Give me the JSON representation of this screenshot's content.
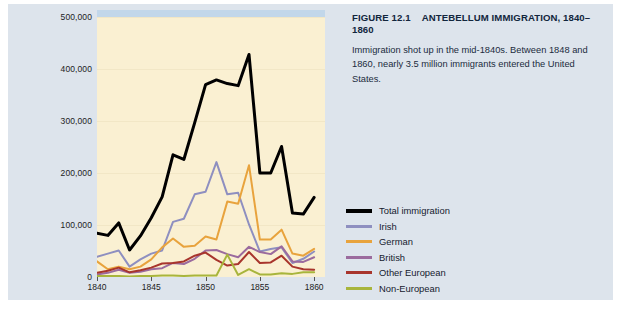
{
  "figure": {
    "label": "FIGURE 12.1",
    "heading": "ANTEBELLUM IMMIGRATION, 1840–1860",
    "caption": "Immigration shot up in the mid-1840s. Between 1848 and 1860, nearly 3.5 million immigrants entered the United States."
  },
  "colors": {
    "panel_background": "#dde4ec",
    "plot_background": "#faf0d2",
    "plot_topband": "#c2d7ea",
    "gridline": "#f2e7c6",
    "total": "#000000",
    "irish": "#8e8fc0",
    "german": "#e8a33d",
    "british": "#9b6b9e",
    "other_european": "#a8352c",
    "non_european": "#a8b53c"
  },
  "chart_data": {
    "type": "line",
    "title": "ANTEBELLUM IMMIGRATION, 1840–1860",
    "xlabel": "",
    "ylabel": "",
    "xlim": [
      1840,
      1861
    ],
    "ylim": [
      0,
      500000
    ],
    "grid": true,
    "legend_position": "right",
    "x": [
      1840,
      1841,
      1842,
      1843,
      1844,
      1845,
      1846,
      1847,
      1848,
      1849,
      1850,
      1851,
      1852,
      1853,
      1854,
      1855,
      1856,
      1857,
      1858,
      1859,
      1860
    ],
    "xticks": [
      1840,
      1845,
      1850,
      1855,
      1860
    ],
    "xticklabels": [
      "1840",
      "1845",
      "1850",
      "1855",
      "1860"
    ],
    "yticks": [
      0,
      100000,
      200000,
      300000,
      400000,
      500000
    ],
    "yticklabels": [
      "0",
      "100,000",
      "200,000",
      "300,000",
      "400,000",
      "500,000"
    ],
    "series": [
      {
        "name": "Total immigration",
        "color": "#000000",
        "width": 3.0,
        "values": [
          84000,
          80000,
          104000,
          52000,
          79000,
          114000,
          154000,
          235000,
          226000,
          297000,
          370000,
          379000,
          372000,
          368000,
          428000,
          200000,
          200000,
          251000,
          123000,
          121000,
          153000
        ]
      },
      {
        "name": "Irish",
        "color": "#8e8fc0",
        "width": 2.0,
        "values": [
          39000,
          45000,
          51000,
          20000,
          34000,
          45000,
          51000,
          106000,
          112000,
          159000,
          164000,
          221000,
          159000,
          162000,
          101000,
          49000,
          54000,
          57000,
          27000,
          35000,
          49000
        ]
      },
      {
        "name": "German",
        "color": "#e8a33d",
        "width": 2.0,
        "values": [
          30000,
          15000,
          20000,
          15000,
          20000,
          34000,
          57000,
          74000,
          58000,
          60000,
          78000,
          72000,
          145000,
          141000,
          215000,
          72000,
          72000,
          91000,
          45000,
          41000,
          54000
        ]
      },
      {
        "name": "British",
        "color": "#9b6b9e",
        "width": 2.0,
        "values": [
          5000,
          8000,
          14000,
          8000,
          10000,
          15000,
          17000,
          27000,
          25000,
          35000,
          51000,
          52000,
          44000,
          38000,
          58000,
          48000,
          44000,
          59000,
          30000,
          29000,
          38000
        ]
      },
      {
        "name": "Other European",
        "color": "#a8352c",
        "width": 2.0,
        "values": [
          8000,
          12000,
          18000,
          9000,
          13000,
          18000,
          26000,
          27000,
          30000,
          41000,
          47000,
          33000,
          22000,
          25000,
          48000,
          27000,
          28000,
          41000,
          20000,
          15000,
          14000
        ]
      },
      {
        "name": "Non-European",
        "color": "#a8b53c",
        "width": 2.0,
        "values": [
          2000,
          2000,
          2000,
          1000,
          2000,
          2000,
          3000,
          3000,
          2000,
          3000,
          3000,
          3000,
          43000,
          4000,
          15000,
          5000,
          5000,
          7000,
          6000,
          9000,
          9000
        ]
      }
    ]
  },
  "legend": {
    "items": [
      {
        "label": "Total immigration",
        "color": "#000000",
        "thick": true
      },
      {
        "label": "Irish",
        "color": "#8e8fc0",
        "thick": false
      },
      {
        "label": "German",
        "color": "#e8a33d",
        "thick": false
      },
      {
        "label": "British",
        "color": "#9b6b9e",
        "thick": false
      },
      {
        "label": "Other European",
        "color": "#a8352c",
        "thick": false
      },
      {
        "label": "Non-European",
        "color": "#a8b53c",
        "thick": false
      }
    ]
  }
}
